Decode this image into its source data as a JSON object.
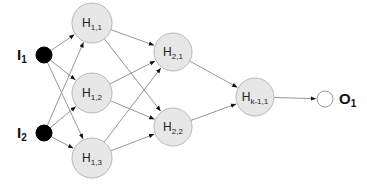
{
  "diagram": {
    "type": "feedforward-neural-network",
    "colors": {
      "edge": "#8a8a8a",
      "hidden_fill": "#e7e7e7",
      "hidden_stroke": "#b8b8b8",
      "input_fill": "#000000",
      "output_fill": "#ffffff"
    },
    "inputs": [
      {
        "id": "I1",
        "main": "I",
        "sub": "1",
        "cx": 44,
        "cy": 55,
        "r": 8
      },
      {
        "id": "I2",
        "main": "I",
        "sub": "2",
        "cx": 44,
        "cy": 133,
        "r": 8
      }
    ],
    "hidden": [
      {
        "id": "H11",
        "main": "H",
        "sub": "1,1",
        "cx": 92,
        "cy": 23,
        "r": 20
      },
      {
        "id": "H12",
        "main": "H",
        "sub": "1,2",
        "cx": 92,
        "cy": 93,
        "r": 20
      },
      {
        "id": "H13",
        "main": "H",
        "sub": "1,3",
        "cx": 92,
        "cy": 158,
        "r": 20
      },
      {
        "id": "H21",
        "main": "H",
        "sub": "2,1",
        "cx": 173,
        "cy": 52,
        "r": 19
      },
      {
        "id": "H22",
        "main": "H",
        "sub": "2,2",
        "cx": 173,
        "cy": 127,
        "r": 19
      },
      {
        "id": "Hk11",
        "main": "H",
        "sub": "k-1,1",
        "cx": 255,
        "cy": 97,
        "r": 19
      }
    ],
    "outputs": [
      {
        "id": "O1",
        "main": "O",
        "sub": "1",
        "cx": 325,
        "cy": 99,
        "r": 8
      }
    ],
    "labels": {
      "I1": {
        "main": "I",
        "sub": "1"
      },
      "I2": {
        "main": "I",
        "sub": "2"
      },
      "O1": {
        "main": "O",
        "sub": "1"
      }
    },
    "edges": [
      [
        "I1",
        "H11"
      ],
      [
        "I1",
        "H12"
      ],
      [
        "I1",
        "H13"
      ],
      [
        "I2",
        "H11"
      ],
      [
        "I2",
        "H12"
      ],
      [
        "I2",
        "H13"
      ],
      [
        "H11",
        "H21"
      ],
      [
        "H11",
        "H22"
      ],
      [
        "H12",
        "H21"
      ],
      [
        "H12",
        "H22"
      ],
      [
        "H13",
        "H21"
      ],
      [
        "H13",
        "H22"
      ],
      [
        "H21",
        "Hk11"
      ],
      [
        "H22",
        "Hk11"
      ],
      [
        "Hk11",
        "O1"
      ]
    ]
  }
}
